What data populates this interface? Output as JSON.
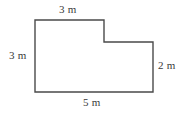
{
  "figure": {
    "type": "geometry-diagram",
    "shape_name": "L-shaped-polygon",
    "stroke_color": "#4a4a4a",
    "fill_color": "#ffffff",
    "background_color": "#ffffff",
    "stroke_width": 1.4,
    "outline_points": "35,20 104,20 104,42 153,42 153,92 35,92",
    "labels": {
      "top": "3 m",
      "left": "3 m",
      "right": "2 m",
      "bottom": "5 m"
    },
    "dimensions": [
      {
        "name": "top-edge",
        "value": 3,
        "unit": "m",
        "text": "3 m"
      },
      {
        "name": "left-edge",
        "value": 3,
        "unit": "m",
        "text": "3 m"
      },
      {
        "name": "right-edge",
        "value": 2,
        "unit": "m",
        "text": "2 m"
      },
      {
        "name": "bottom-edge",
        "value": 5,
        "unit": "m",
        "text": "5 m"
      }
    ]
  }
}
